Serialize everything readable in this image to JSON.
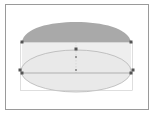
{
  "canvas": {
    "width": 154,
    "height": 116,
    "background": "#ffffff"
  },
  "frame": {
    "x": 5,
    "y": 4,
    "w": 144,
    "h": 106,
    "stroke": "#9a9a9a"
  },
  "shapes": {
    "top_cap": {
      "fill": "#a9a9a9",
      "x1": 22,
      "x2": 131,
      "y_base": 42,
      "y_top": 22
    },
    "body_rect": {
      "fill": "#eeeeee",
      "x": 22,
      "y": 42,
      "w": 109,
      "h": 31
    },
    "ellipse": {
      "cx": 76,
      "cy": 72,
      "rx": 56,
      "ry": 23,
      "fill": "#e6e6e6",
      "stroke": "#b0b0b0"
    },
    "selection_box": {
      "x": 20,
      "y": 42,
      "w": 113,
      "h": 49,
      "stroke": "#c8c8c8"
    }
  },
  "handles": [
    {
      "name": "handle-top-left",
      "x": 22,
      "y": 42
    },
    {
      "name": "handle-top-right",
      "x": 131,
      "y": 42
    },
    {
      "name": "handle-top-center",
      "x": 76,
      "y": 49
    },
    {
      "name": "handle-center",
      "x": 76,
      "y": 57
    },
    {
      "name": "handle-middle-center",
      "x": 76,
      "y": 70
    },
    {
      "name": "handle-left",
      "x": 20,
      "y": 70
    },
    {
      "name": "handle-left-lower",
      "x": 22,
      "y": 73
    },
    {
      "name": "handle-right",
      "x": 133,
      "y": 70
    },
    {
      "name": "handle-right-lower",
      "x": 131,
      "y": 73
    }
  ],
  "colors": {
    "handle": "#555555",
    "guide": "#cccccc"
  }
}
